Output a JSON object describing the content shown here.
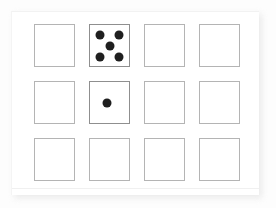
{
  "scene": {
    "description": "Photograph of a printed worksheet card showing a 4-column by 3-row grid of empty squares; one square contains a die face of five dots and another contains a single dot.",
    "background_color": "#fdfdfd",
    "card": {
      "fill_color": "#ffffff",
      "shadow_color": "#e4e4e4",
      "crease_color": "#f0f0f0"
    },
    "grid": {
      "columns": 4,
      "rows": 3,
      "cell_border_color": "#b4b4b4",
      "die_cell_border_color": "#8f8f8f",
      "pip_color": "#1f1f1f",
      "cells": [
        {
          "row": 1,
          "column": 1,
          "label": "empty-square",
          "pip_count": 0,
          "pips": []
        },
        {
          "row": 1,
          "column": 2,
          "label": "die-face-five",
          "pip_count": 5,
          "pips": [
            {
              "x_pct": 25,
              "y_pct": 24
            },
            {
              "x_pct": 75,
              "y_pct": 24
            },
            {
              "x_pct": 50,
              "y_pct": 50
            },
            {
              "x_pct": 25,
              "y_pct": 77
            },
            {
              "x_pct": 75,
              "y_pct": 77
            }
          ]
        },
        {
          "row": 1,
          "column": 3,
          "label": "empty-square",
          "pip_count": 0,
          "pips": []
        },
        {
          "row": 1,
          "column": 4,
          "label": "empty-square",
          "pip_count": 0,
          "pips": []
        },
        {
          "row": 2,
          "column": 1,
          "label": "empty-square",
          "pip_count": 0,
          "pips": []
        },
        {
          "row": 2,
          "column": 2,
          "label": "die-face-one",
          "pip_count": 1,
          "pips": [
            {
              "x_pct": 44,
              "y_pct": 50
            }
          ]
        },
        {
          "row": 2,
          "column": 3,
          "label": "empty-square",
          "pip_count": 0,
          "pips": []
        },
        {
          "row": 2,
          "column": 4,
          "label": "empty-square",
          "pip_count": 0,
          "pips": []
        },
        {
          "row": 3,
          "column": 1,
          "label": "empty-square",
          "pip_count": 0,
          "pips": []
        },
        {
          "row": 3,
          "column": 2,
          "label": "empty-square",
          "pip_count": 0,
          "pips": []
        },
        {
          "row": 3,
          "column": 3,
          "label": "empty-square",
          "pip_count": 0,
          "pips": []
        },
        {
          "row": 3,
          "column": 4,
          "label": "empty-square",
          "pip_count": 0,
          "pips": []
        }
      ]
    }
  }
}
